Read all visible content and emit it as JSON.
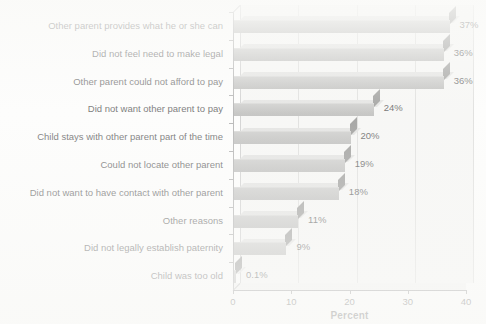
{
  "chart_data": {
    "type": "bar",
    "orientation": "horizontal",
    "title": "",
    "xlabel": "Percent",
    "ylabel": "",
    "xlim": [
      0,
      40
    ],
    "xticks": [
      "0",
      "10",
      "20",
      "30",
      "40"
    ],
    "grid": true,
    "legend": "none",
    "style": "3d-horizontal-bars",
    "categories": [
      "Other parent provides what he or she can",
      "Did not feel need to make legal",
      "Other parent could not afford to pay",
      "Did not want other parent to pay",
      "Child stays with other parent part of the time",
      "Could not locate other parent",
      "Did not want to have contact with other parent",
      "Other reasons",
      "Did not legally establish paternity",
      "Child was too old"
    ],
    "values": [
      37,
      36,
      36,
      24,
      20,
      19,
      18,
      11,
      9,
      0.1
    ],
    "value_labels": [
      "37%",
      "36%",
      "36%",
      "24%",
      "20%",
      "19%",
      "18%",
      "11%",
      "9%",
      "0.1%"
    ]
  },
  "colors": {
    "bar_front": "#ababa9",
    "bar_top": "#d6d6d4",
    "bar_cap": "#6d6d6b",
    "plot_background": "#f3f3f1",
    "axis": "#6f6f6f",
    "gridline": "#cfcfcd",
    "text": "#151515"
  }
}
